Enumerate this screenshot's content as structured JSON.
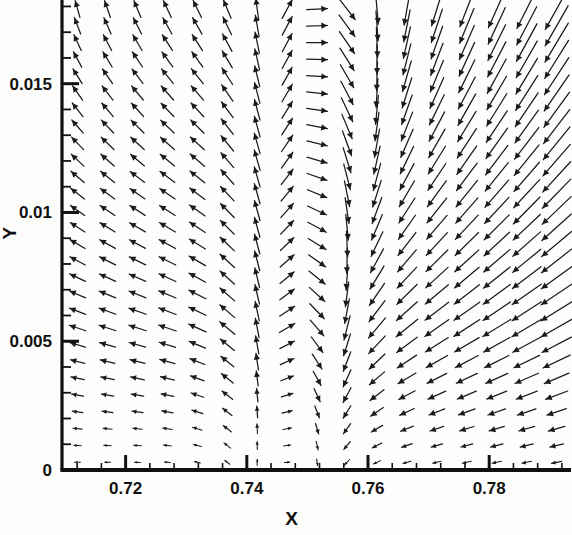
{
  "chart_data": {
    "type": "scatter",
    "plot_kind": "vector-field-quiver",
    "title": "",
    "subtitle": "",
    "xlabel": "X",
    "ylabel": "Y",
    "xlim": [
      0.7095,
      0.7935
    ],
    "ylim": [
      0.0,
      0.01825
    ],
    "grid": false,
    "legend": null,
    "annotations": [],
    "xticks": [
      0.72,
      0.74,
      0.76,
      0.78
    ],
    "xtick_labels": [
      "0.72",
      "0.74",
      "0.76",
      "0.78"
    ],
    "yticks": [
      0,
      0.005,
      0.01,
      0.015
    ],
    "ytick_labels": [
      "0",
      "0.005",
      "0.01",
      "0.015"
    ],
    "x_minor_step": 0.004,
    "y_minor_step": 0.001,
    "axes_visible": {
      "left": true,
      "bottom": true,
      "top": false,
      "right": false
    },
    "axis_color": "#111111",
    "vector_color": "#1a1a1a",
    "background": "#fdfdfb",
    "grid_columns": 17,
    "grid_rows": 28,
    "samples": [
      {
        "x": 0.711,
        "y": 0.0175,
        "u": -0.1,
        "v": 0.99
      },
      {
        "x": 0.711,
        "y": 0.01,
        "u": -0.62,
        "v": 0.78
      },
      {
        "x": 0.711,
        "y": 0.004,
        "u": -0.96,
        "v": 0.26
      },
      {
        "x": 0.711,
        "y": 0.0008,
        "u": -0.6,
        "v": 0.05
      },
      {
        "x": 0.725,
        "y": 0.0175,
        "u": -0.28,
        "v": 0.95
      },
      {
        "x": 0.725,
        "y": 0.01,
        "u": -0.8,
        "v": 0.58
      },
      {
        "x": 0.725,
        "y": 0.004,
        "u": -0.99,
        "v": 0.1
      },
      {
        "x": 0.74,
        "y": 0.0175,
        "u": -0.6,
        "v": 0.78
      },
      {
        "x": 0.74,
        "y": 0.01,
        "u": -0.98,
        "v": 0.18
      },
      {
        "x": 0.74,
        "y": 0.004,
        "u": -1.0,
        "v": -0.04
      },
      {
        "x": 0.748,
        "y": 0.0175,
        "u": 0.4,
        "v": 0.91
      },
      {
        "x": 0.748,
        "y": 0.01,
        "u": 0.55,
        "v": 0.83
      },
      {
        "x": 0.748,
        "y": 0.004,
        "u": -0.7,
        "v": -0.25
      },
      {
        "x": 0.76,
        "y": 0.0175,
        "u": -0.12,
        "v": -0.99
      },
      {
        "x": 0.76,
        "y": 0.01,
        "u": -0.35,
        "v": -0.93
      },
      {
        "x": 0.76,
        "y": 0.004,
        "u": -0.92,
        "v": -0.38
      },
      {
        "x": 0.775,
        "y": 0.0175,
        "u": -0.3,
        "v": -0.95
      },
      {
        "x": 0.775,
        "y": 0.01,
        "u": -0.45,
        "v": -0.89
      },
      {
        "x": 0.775,
        "y": 0.004,
        "u": -0.88,
        "v": -0.47
      },
      {
        "x": 0.79,
        "y": 0.0175,
        "u": -0.34,
        "v": -0.94
      },
      {
        "x": 0.79,
        "y": 0.01,
        "u": -0.5,
        "v": -0.86
      },
      {
        "x": 0.79,
        "y": 0.004,
        "u": -0.8,
        "v": -0.6
      }
    ]
  },
  "axes": {
    "x_label": "X",
    "y_label": "Y"
  }
}
